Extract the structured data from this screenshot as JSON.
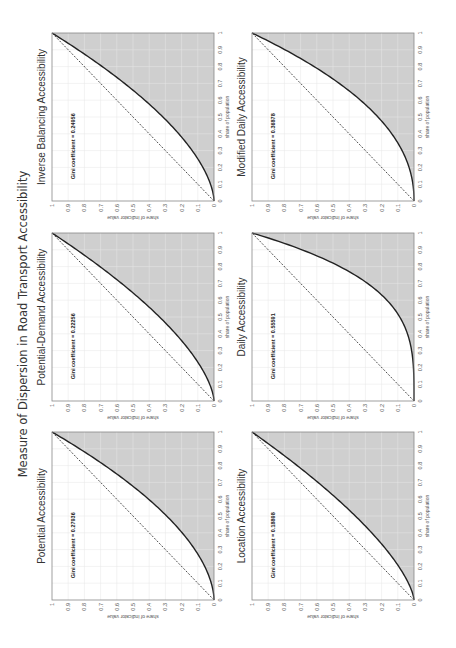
{
  "figure": {
    "title": "Measure of Dispersion in Road Transport Accessibility"
  },
  "chart_data": [
    {
      "type": "area",
      "title": "Potential Accessibility",
      "gini": 0.27936,
      "annotation": "Gini coefficient = 0.27936",
      "xlabel": "share of population",
      "ylabel": "share of indicator value",
      "xlim": [
        0,
        1
      ],
      "ylim": [
        0,
        1
      ],
      "grid": true,
      "row": 0,
      "col": 0,
      "shade_color": "#cfcfcf"
    },
    {
      "type": "area",
      "title": "Potential-Demand Accessibility",
      "gini": 0.22256,
      "annotation": "Gini coefficient = 0.22256",
      "xlabel": "share of population",
      "ylabel": "share of indicator value",
      "xlim": [
        0,
        1
      ],
      "ylim": [
        0,
        1
      ],
      "grid": true,
      "row": 0,
      "col": 1,
      "shade_color": "#cfcfcf"
    },
    {
      "type": "area",
      "title": "Inverse Balancing Accessibility",
      "gini": 0.24956,
      "annotation": "Gini coefficient = 0.24956",
      "xlabel": "share of population",
      "ylabel": "share of indicator value",
      "xlim": [
        0,
        1
      ],
      "ylim": [
        0,
        1
      ],
      "grid": true,
      "row": 0,
      "col": 2,
      "shade_color": "#cfcfcf"
    },
    {
      "type": "area",
      "title": "Location Accessibility",
      "gini": 0.18898,
      "annotation": "Gini coefficient = 0.18898",
      "xlabel": "share of population",
      "ylabel": "share of indicator value",
      "xlim": [
        0,
        1
      ],
      "ylim": [
        0,
        1
      ],
      "grid": true,
      "row": 1,
      "col": 0,
      "shade_color": "#cfcfcf"
    },
    {
      "type": "area",
      "title": "Daily Accessibility",
      "gini": 0.55591,
      "annotation": "Gini coefficient = 0.55591",
      "xlabel": "share of population",
      "ylabel": "share of indicator value",
      "xlim": [
        0,
        1
      ],
      "ylim": [
        0,
        1
      ],
      "grid": true,
      "row": 1,
      "col": 1,
      "shade_color": "#cfcfcf"
    },
    {
      "type": "area",
      "title": "Modified Daily Accessibility",
      "gini": 0.36878,
      "annotation": "Gini coefficient = 0.36878",
      "xlabel": "share of population",
      "ylabel": "share of indicator value",
      "xlim": [
        0,
        1
      ],
      "ylim": [
        0,
        1
      ],
      "grid": true,
      "row": 1,
      "col": 2,
      "shade_color": "#cfcfcf"
    }
  ],
  "ticks": [
    "0",
    "0.1",
    "0.2",
    "0.3",
    "0.4",
    "0.5",
    "0.6",
    "0.7",
    "0.8",
    "0.9",
    "1"
  ]
}
